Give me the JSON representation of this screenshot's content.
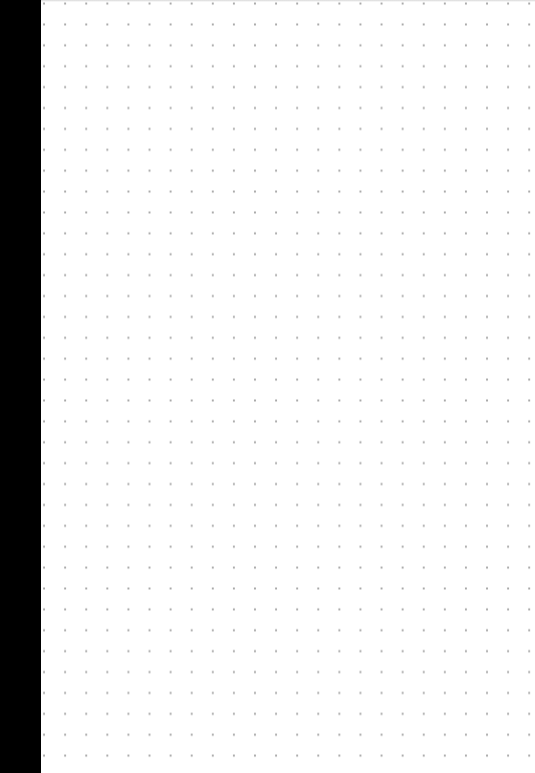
{
  "page": {
    "type": "dot-grid-paper",
    "background_color": "#ffffff",
    "dot_color": "#a8a8a8",
    "dot_spacing_px": 21,
    "left_edge_color": "#000000"
  }
}
